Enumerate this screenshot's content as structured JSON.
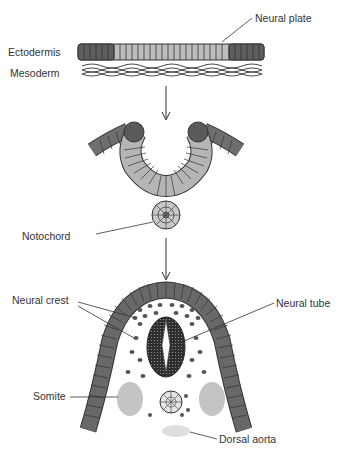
{
  "diagram": {
    "stages": [
      {
        "name": "neural-plate-stage",
        "labels": {
          "neural_plate": "Neural plate",
          "ectodermis": "Ectodermis",
          "mesoderm": "Mesoderm"
        }
      },
      {
        "name": "neural-groove-stage",
        "labels": {
          "notochord": "Notochord"
        }
      },
      {
        "name": "neural-tube-stage",
        "labels": {
          "neural_crest": "Neural crest",
          "neural_tube": "Neural tube",
          "somite": "Somite",
          "dorsal_aorta": "Dorsal aorta"
        }
      }
    ],
    "colors": {
      "dark_cell": "#5a5a5a",
      "light_cell": "#b8b8b8",
      "mid_cell": "#7d7d7d",
      "somite": "#c4c4c4",
      "aorta": "#dedede",
      "outline": "#333333"
    }
  }
}
